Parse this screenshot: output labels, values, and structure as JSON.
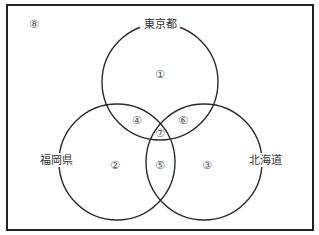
{
  "diagram": {
    "type": "venn-3",
    "universe_label": "⑧",
    "sets": [
      {
        "id": "tokyo",
        "label": "東京都",
        "cx": 160,
        "cy": 82,
        "r": 58,
        "label_x": 160,
        "label_y": 24
      },
      {
        "id": "fukuoka",
        "label": "福岡県",
        "cx": 117,
        "cy": 162,
        "r": 58,
        "label_x": 56,
        "label_y": 160
      },
      {
        "id": "hokkaido",
        "label": "北海道",
        "cx": 204,
        "cy": 162,
        "r": 58,
        "label_x": 265,
        "label_y": 160
      }
    ],
    "regions": [
      {
        "label": "①",
        "meaning": "東京都 only",
        "x": 160,
        "y": 74
      },
      {
        "label": "②",
        "meaning": "福岡県 only",
        "x": 115,
        "y": 165
      },
      {
        "label": "③",
        "meaning": "北海道 only",
        "x": 207,
        "y": 165
      },
      {
        "label": "④",
        "meaning": "東京都 ∩ 福岡県",
        "x": 137,
        "y": 120
      },
      {
        "label": "⑤",
        "meaning": "福岡県 ∩ 北海道",
        "x": 160,
        "y": 165
      },
      {
        "label": "⑥",
        "meaning": "東京都 ∩ 北海道",
        "x": 183,
        "y": 120
      },
      {
        "label": "⑦",
        "meaning": "all three",
        "x": 160,
        "y": 133
      },
      {
        "label": "⑧",
        "meaning": "outside all sets",
        "x": 34,
        "y": 24
      }
    ],
    "frame": {
      "x": 7,
      "y": 5,
      "width": 306,
      "height": 225
    },
    "colors": {
      "line": "#2a2a2a",
      "frame": "#222222",
      "text": "#333333",
      "number": "#555555"
    }
  }
}
